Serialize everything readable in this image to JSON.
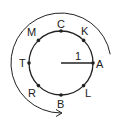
{
  "diagram": {
    "center": {
      "x": 61,
      "y": 63
    },
    "radius_px": 32,
    "radius_label": "1",
    "stroke_color": "#222222",
    "points": [
      {
        "name": "A",
        "angle_deg": 0
      },
      {
        "name": "K",
        "angle_deg": 45
      },
      {
        "name": "C",
        "angle_deg": 90
      },
      {
        "name": "M",
        "angle_deg": 135
      },
      {
        "name": "T",
        "angle_deg": 180
      },
      {
        "name": "R",
        "angle_deg": 225
      },
      {
        "name": "B",
        "angle_deg": 270
      },
      {
        "name": "L",
        "angle_deg": 315
      }
    ],
    "outer_arrow": {
      "description": "counterclockwise curved arrow from near A around top and left to bottom",
      "radius_px": 50,
      "start_angle_deg": 10,
      "end_angle_deg": 270
    }
  }
}
